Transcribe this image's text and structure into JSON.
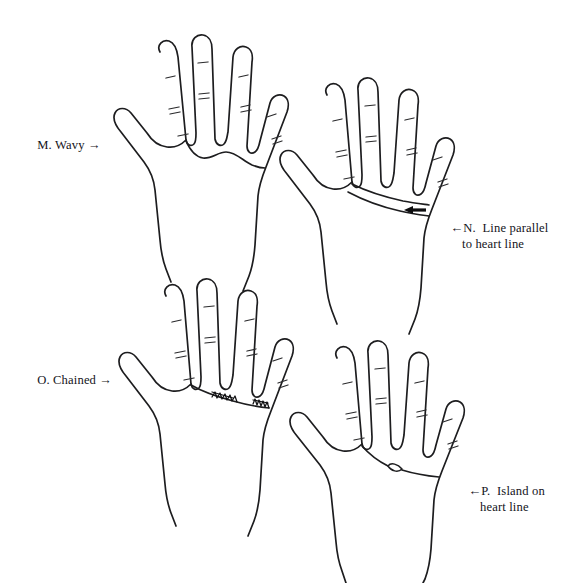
{
  "figure": {
    "background_color": "#ffffff",
    "ink_color": "#1d1d1f",
    "panel_count": 4
  },
  "captions": {
    "m": {
      "label": "M. Wavy",
      "arrow": "→",
      "arrow_direction": "right",
      "full_text": "M. Wavy →"
    },
    "n": {
      "arrow": "←",
      "arrow_direction": "left",
      "line_1": "N.  Line parallel",
      "line_2": "to heart line",
      "full_text": "← N. Line parallel to heart line"
    },
    "o": {
      "label": "O. Chained",
      "arrow": "→",
      "arrow_direction": "right",
      "full_text": "O. Chained →"
    },
    "p": {
      "arrow": "←",
      "arrow_direction": "left",
      "line_1": "P.  Island on",
      "line_2": "heart line",
      "full_text": "← P. Island on heart line"
    }
  },
  "panels": [
    {
      "id": "m",
      "letter": "M",
      "feature": "Wavy",
      "description": "Heart line drawn as an undulating wavy curve across the palm",
      "position": "top-left",
      "marker_type": "wavy-line"
    },
    {
      "id": "n",
      "letter": "N",
      "feature": "Line parallel to heart line",
      "description": "A second line runs parallel below the heart line, indicated by a small solid arrow",
      "position": "top-right",
      "marker_type": "double-parallel-line"
    },
    {
      "id": "o",
      "letter": "O",
      "feature": "Chained",
      "description": "Heart line with chained cross-hatched zigzag segments",
      "position": "bottom-left",
      "marker_type": "chained-line"
    },
    {
      "id": "p",
      "letter": "P",
      "feature": "Island on heart line",
      "description": "Heart line interrupted by a small lens-shaped island",
      "position": "bottom-right",
      "marker_type": "island-line"
    }
  ]
}
